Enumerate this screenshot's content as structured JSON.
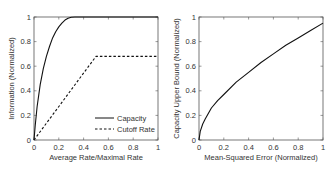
{
  "chart_data": [
    {
      "type": "line",
      "title": "",
      "xlabel": "Average Rate/Maximal Rate",
      "ylabel": "Information (Normalized)",
      "xlim": [
        0,
        1
      ],
      "ylim": [
        0,
        1
      ],
      "xticks": [
        "0",
        "0.2",
        "0.4",
        "0.6",
        "0.8",
        "1"
      ],
      "yticks": [
        "0",
        "0.2",
        "0.4",
        "0.6",
        "0.8",
        "1"
      ],
      "grid": false,
      "legend_position": "lower right",
      "series": [
        {
          "name": "Capacity",
          "style": "solid",
          "x": [
            0,
            0.01,
            0.025,
            0.05,
            0.075,
            0.1,
            0.125,
            0.15,
            0.175,
            0.2,
            0.225,
            0.25,
            0.275,
            0.3,
            0.33,
            0.4,
            0.5,
            0.6,
            0.7,
            0.8,
            0.9,
            1.0
          ],
          "y": [
            0,
            0.12,
            0.27,
            0.45,
            0.58,
            0.68,
            0.76,
            0.83,
            0.88,
            0.92,
            0.95,
            0.975,
            0.99,
            0.998,
            1.0,
            1.0,
            1.0,
            1.0,
            1.0,
            1.0,
            1.0,
            1.0
          ]
        },
        {
          "name": "Cutoff Rate",
          "style": "dashed",
          "x": [
            0,
            0.5,
            1.0
          ],
          "y": [
            0,
            0.68,
            0.68
          ]
        }
      ]
    },
    {
      "type": "line",
      "title": "",
      "xlabel": "Mean-Squared Error (Normalized)",
      "ylabel": "Capacity Upper Bound (Normalized)",
      "xlim": [
        0,
        1
      ],
      "ylim": [
        0,
        1
      ],
      "xticks": [
        "0",
        "0.2",
        "0.4",
        "0.6",
        "0.8",
        "1"
      ],
      "yticks": [
        "0",
        "0.2",
        "0.4",
        "0.6",
        "0.8",
        "1"
      ],
      "grid": false,
      "series": [
        {
          "name": "Capacity Upper Bound",
          "style": "solid",
          "x": [
            0,
            0.01,
            0.03,
            0.05,
            0.1,
            0.15,
            0.2,
            0.3,
            0.4,
            0.5,
            0.6,
            0.7,
            0.8,
            0.9,
            1.0
          ],
          "y": [
            0,
            0.07,
            0.13,
            0.17,
            0.26,
            0.32,
            0.37,
            0.47,
            0.55,
            0.63,
            0.7,
            0.77,
            0.83,
            0.89,
            0.95
          ]
        }
      ]
    }
  ],
  "colors": {
    "axis": "#555555",
    "line": "#111111",
    "text": "#333333"
  }
}
